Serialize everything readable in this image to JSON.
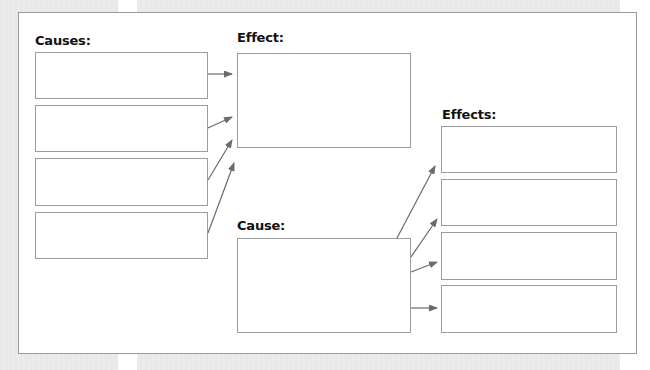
{
  "diagram": {
    "type": "cause-and-effect graphic organizer",
    "colors": {
      "background": "#ebebeb",
      "panel": "#ffffff",
      "border": "#9a9a9a",
      "arrow": "#6a6a6a",
      "text": "#111111"
    },
    "left_section": {
      "causes_label": "Causes:",
      "cause_boxes": [
        "",
        "",
        "",
        ""
      ],
      "effect_label": "Effect:",
      "effect_box": ""
    },
    "right_section": {
      "cause_label": "Cause:",
      "cause_box": "",
      "effects_label": "Effects:",
      "effect_boxes": [
        "",
        "",
        "",
        ""
      ]
    },
    "arrows": [
      {
        "from": "causes[0]",
        "to": "effect"
      },
      {
        "from": "causes[1]",
        "to": "effect"
      },
      {
        "from": "causes[2]",
        "to": "effect"
      },
      {
        "from": "causes[3]",
        "to": "effect"
      },
      {
        "from": "cause",
        "to": "effects[0]"
      },
      {
        "from": "cause",
        "to": "effects[1]"
      },
      {
        "from": "cause",
        "to": "effects[2]"
      },
      {
        "from": "cause",
        "to": "effects[3]"
      }
    ]
  }
}
